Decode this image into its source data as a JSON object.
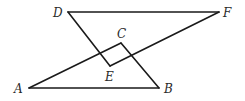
{
  "diagram": {
    "type": "geometry",
    "background": "#ffffff",
    "line_color": "#1a1a1a",
    "points": {
      "A": {
        "label": "A",
        "x": 29,
        "y": 88,
        "lx": 14,
        "ly": 93
      },
      "B": {
        "label": "B",
        "x": 159,
        "y": 88,
        "lx": 164,
        "ly": 93
      },
      "C": {
        "label": "C",
        "x": 121,
        "y": 43,
        "lx": 117,
        "ly": 38
      },
      "D": {
        "label": "D",
        "x": 68,
        "y": 12,
        "lx": 53,
        "ly": 17
      },
      "E": {
        "label": "E",
        "x": 110,
        "y": 66,
        "lx": 105,
        "ly": 81
      },
      "F": {
        "label": "F",
        "x": 219,
        "y": 12,
        "lx": 223,
        "ly": 17
      }
    },
    "triangles": [
      {
        "name": "triangle-ABC",
        "vertices": [
          "A",
          "B",
          "C"
        ]
      },
      {
        "name": "triangle-DEF",
        "vertices": [
          "D",
          "E",
          "F"
        ]
      }
    ]
  }
}
